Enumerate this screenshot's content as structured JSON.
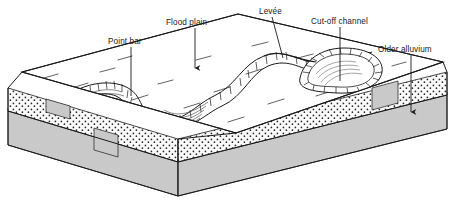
{
  "figure": {
    "type": "geological-block-diagram",
    "background_color": "#ffffff",
    "line_color": "#1a1a1a",
    "labels": [
      {
        "id": "point-bar",
        "text": "Point bar",
        "x": 108,
        "y": 44,
        "leader": "line",
        "leader_from": [
          131,
          47
        ],
        "leader_to": [
          131,
          96
        ]
      },
      {
        "id": "flood-plain",
        "text": "Flood plain",
        "x": 166,
        "y": 25,
        "leader": "arrow",
        "leader_from": [
          195,
          28
        ],
        "leader_to": [
          195,
          72
        ]
      },
      {
        "id": "levee",
        "text": "Levée",
        "x": 259,
        "y": 14,
        "leader": "line",
        "leader_from": [
          272,
          17
        ],
        "leader_to": [
          283,
          58
        ]
      },
      {
        "id": "cut-off-channel",
        "text": "Cut-off channel",
        "x": 311,
        "y": 24,
        "leader": "line",
        "leader_from": [
          340,
          27
        ],
        "leader_to": [
          340,
          81
        ]
      },
      {
        "id": "older-alluvium",
        "text": "Older alluvium",
        "x": 378,
        "y": 52,
        "leader": "arrow",
        "leader_from": [
          411,
          55
        ],
        "leader_to": [
          411,
          116
        ]
      }
    ],
    "strata": [
      {
        "id": "flood-plain-surface",
        "name": "Flood plain surface",
        "fill": "#ffffff",
        "pattern": "sparse-diagonal-ticks"
      },
      {
        "id": "alluvium-layer",
        "name": "Older alluvium",
        "fill": "#f7f7f7",
        "pattern": "stipple-dots"
      },
      {
        "id": "bedrock-layer",
        "name": "Bedrock",
        "fill": "#c9c9c9",
        "pattern": "solid"
      }
    ],
    "features": [
      {
        "id": "meander-channel",
        "name": "Meandering river channel",
        "pattern": "hachured-banks"
      },
      {
        "id": "point-bar-scrolls",
        "name": "Point bar scroll bars",
        "pattern": "curved-accretion-lines"
      },
      {
        "id": "oxbow-lake",
        "name": "Cut-off channel (oxbow)",
        "pattern": "hachured-banks"
      }
    ]
  }
}
